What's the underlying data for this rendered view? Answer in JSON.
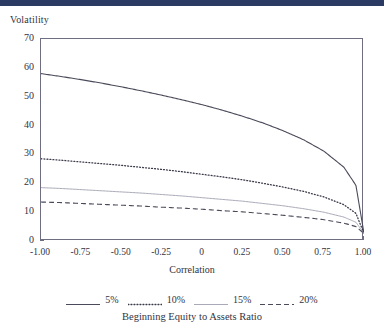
{
  "top_bar": {
    "color": "#2b3a62"
  },
  "figure": {
    "y_axis_title": "Volatility",
    "x_axis_title": "Correlation",
    "legend_title": "Beginning Equity to Assets Ratio"
  },
  "chart_data": {
    "type": "line",
    "title": "",
    "xlabel": "Correlation",
    "ylabel": "Volatility",
    "xlim": [
      -1.0,
      1.0
    ],
    "ylim": [
      0,
      70
    ],
    "xticks": [
      "-1.00",
      "-0.75",
      "-0.50",
      "-0.25",
      "0",
      "0.25",
      "0.50",
      "0.75",
      "1.00"
    ],
    "xtick_values": [
      -1.0,
      -0.75,
      -0.5,
      -0.25,
      0,
      0.25,
      0.5,
      0.75,
      1.0
    ],
    "yticks": [
      "0",
      "10",
      "20",
      "30",
      "40",
      "50",
      "60",
      "70"
    ],
    "ytick_values": [
      0,
      10,
      20,
      30,
      40,
      50,
      60,
      70
    ],
    "grid": false,
    "legend_position": "below",
    "legend_title": "Beginning Equity to Assets Ratio",
    "x": [
      -1.0,
      -0.875,
      -0.75,
      -0.625,
      -0.5,
      -0.375,
      -0.25,
      -0.125,
      0,
      0.125,
      0.25,
      0.375,
      0.5,
      0.625,
      0.75,
      0.875,
      0.95,
      1.0
    ],
    "series": [
      {
        "name": "5%",
        "label": "5%",
        "style": "solid",
        "color": "#4a4a5a",
        "width": 1.1,
        "values": [
          58.0,
          57.0,
          55.9,
          54.7,
          53.4,
          52.0,
          50.5,
          48.9,
          47.2,
          45.3,
          43.2,
          40.9,
          38.2,
          35.1,
          31.2,
          25.6,
          19.3,
          2.6
        ]
      },
      {
        "name": "10%",
        "label": "10%",
        "style": "dotted",
        "color": "#3a3a4a",
        "width": 1.3,
        "values": [
          28.5,
          28.0,
          27.4,
          26.8,
          26.2,
          25.5,
          24.8,
          24.0,
          23.1,
          22.2,
          21.2,
          20.0,
          18.7,
          17.2,
          15.3,
          12.6,
          9.6,
          2.6
        ]
      },
      {
        "name": "15%",
        "label": "15%",
        "style": "solid",
        "color": "#a9a9b8",
        "width": 1.0,
        "values": [
          18.5,
          18.2,
          17.8,
          17.4,
          17.0,
          16.6,
          16.1,
          15.6,
          15.0,
          14.4,
          13.8,
          13.0,
          12.2,
          11.2,
          10.0,
          8.3,
          6.5,
          2.6
        ]
      },
      {
        "name": "20%",
        "label": "20%",
        "style": "dashed",
        "color": "#4a4a5a",
        "width": 1.1,
        "values": [
          13.5,
          13.3,
          13.0,
          12.7,
          12.4,
          12.1,
          11.7,
          11.4,
          11.0,
          10.5,
          10.1,
          9.5,
          8.9,
          8.2,
          7.4,
          6.2,
          5.0,
          2.6
        ]
      }
    ]
  }
}
